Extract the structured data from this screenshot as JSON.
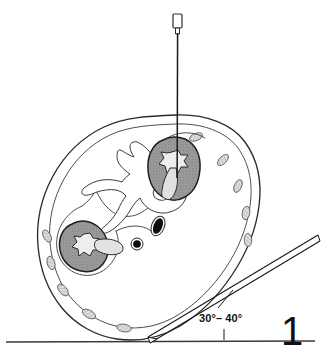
{
  "figure": {
    "number": "1",
    "angle_label": "30°– 40°",
    "type": "anatomical-line-drawing"
  },
  "colors": {
    "background": "#ffffff",
    "ink": "#1a1a1a",
    "outline": "#2b2b2b",
    "kidney_fill": "#9a9a9a",
    "kidney_stipple": "#6e6e6e",
    "calyx_fill": "#e8e8e8",
    "pelvis_fill": "#dcdcdc",
    "vessel_fill": "#111111",
    "rib_fill": "#d8d8d8",
    "baseline": "#3a3a3a",
    "needle": "#1a1a1a"
  },
  "structures": {
    "body_wall": "body-wall-outline",
    "retroperitoneum": "retroperitoneal-fascia-outline",
    "vertebra": "lumbar-vertebra",
    "kidney_upper": "right-kidney-target",
    "kidney_lower": "left-kidney",
    "aorta": "aorta-vessel",
    "vena_cava": "inferior-vena-cava-vessel",
    "needle_vertical": "puncture-needle-vertical",
    "needle_oblique": "puncture-needle-oblique",
    "baseline": "table-baseline",
    "angle_leader": "angle-leader-line",
    "angle_tick": "angle-tick-mark"
  },
  "rib_markers": [
    {
      "cx": 196,
      "cy": 137,
      "rx": 7.0,
      "ry": 3.6,
      "rot": -22
    },
    {
      "cx": 223,
      "cy": 160,
      "rx": 7.0,
      "ry": 3.6,
      "rot": -46
    },
    {
      "cx": 238,
      "cy": 186,
      "rx": 6.8,
      "ry": 3.6,
      "rot": -66
    },
    {
      "cx": 246,
      "cy": 213,
      "rx": 6.8,
      "ry": 3.8,
      "rot": -80
    },
    {
      "cx": 248,
      "cy": 240,
      "rx": 6.6,
      "ry": 3.8,
      "rot": -92
    },
    {
      "cx": 47,
      "cy": 236,
      "rx": 6.6,
      "ry": 3.6,
      "rot": 62
    },
    {
      "cx": 51,
      "cy": 263,
      "rx": 6.8,
      "ry": 3.8,
      "rot": 74
    },
    {
      "cx": 63,
      "cy": 290,
      "rx": 7.0,
      "ry": 3.8,
      "rot": 50
    },
    {
      "cx": 89,
      "cy": 314,
      "rx": 7.2,
      "ry": 3.8,
      "rot": 28
    },
    {
      "cx": 124,
      "cy": 328,
      "rx": 7.4,
      "ry": 3.8,
      "rot": 10
    }
  ]
}
